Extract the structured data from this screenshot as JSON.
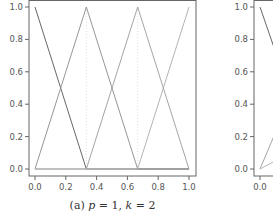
{
  "chart_data": [
    {
      "type": "line",
      "title": "",
      "caption": "(a) p = 1, k = 2",
      "caption_parts": {
        "prefix": "(a) ",
        "p_var": "p",
        "p_eq": " = 1, ",
        "k_var": "k",
        "k_eq": " = 2"
      },
      "xlabel": "",
      "ylabel": "",
      "xlim": [
        0.0,
        1.0
      ],
      "ylim": [
        0.0,
        1.0
      ],
      "xticks": [
        "0.0",
        "0.2",
        "0.4",
        "0.6",
        "0.8",
        "1.0"
      ],
      "yticks": [
        "0.0",
        "0.2",
        "0.4",
        "0.6",
        "0.8",
        "1.0"
      ],
      "grid": false,
      "knots_dotted_vertical": [
        0.3333,
        0.6667
      ],
      "series": [
        {
          "name": "B1",
          "x": [
            0.0,
            0.3333,
            1.0
          ],
          "y": [
            1.0,
            0.0,
            0.0
          ],
          "color": "#555555"
        },
        {
          "name": "B2",
          "x": [
            0.0,
            0.3333,
            0.6667,
            1.0
          ],
          "y": [
            0.0,
            1.0,
            0.0,
            0.0
          ],
          "color": "#8a8a8a"
        },
        {
          "name": "B3",
          "x": [
            0.0,
            0.3333,
            0.6667,
            1.0
          ],
          "y": [
            0.0,
            0.0,
            1.0,
            0.0
          ],
          "color": "#9a9a9a"
        },
        {
          "name": "B4",
          "x": [
            0.0,
            0.6667,
            1.0
          ],
          "y": [
            0.0,
            0.0,
            1.0
          ],
          "color": "#aaaaaa"
        }
      ]
    },
    {
      "type": "line",
      "title": "",
      "caption": "",
      "xlim": [
        0.0,
        1.0
      ],
      "ylim": [
        0.0,
        1.0
      ],
      "xticks": [
        "0.0"
      ],
      "yticks": [
        "0.0",
        "0.2",
        "0.4",
        "0.6",
        "0.8",
        "1.0"
      ],
      "partial": true,
      "series": [
        {
          "name": "B1",
          "x": [
            0.0,
            0.2
          ],
          "y": [
            1.0,
            0.45
          ],
          "color": "#555555"
        },
        {
          "name": "B2",
          "x": [
            0.0,
            0.2
          ],
          "y": [
            0.0,
            0.45
          ],
          "color": "#9a9a9a"
        },
        {
          "name": "B3",
          "x": [
            0.0,
            0.2
          ],
          "y": [
            0.0,
            0.1
          ],
          "color": "#b0b0b0"
        }
      ]
    }
  ]
}
